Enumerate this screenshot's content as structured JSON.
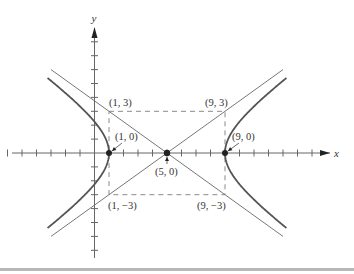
{
  "figure": {
    "equation": "(x-5)^2/16 - y^2/9 = 1",
    "axes": {
      "x_label": "x",
      "y_label": "y",
      "x_ticks_range": [
        -6,
        15
      ],
      "y_ticks_range": [
        -7,
        8
      ]
    },
    "points": [
      {
        "id": "vertex-left",
        "label": "(1, 0)",
        "x": 1,
        "y": 0
      },
      {
        "id": "center",
        "label": "(5, 0)",
        "x": 5,
        "y": 0
      },
      {
        "id": "vertex-right",
        "label": "(9, 0)",
        "x": 9,
        "y": 0
      }
    ],
    "rectangle_corners": [
      {
        "id": "top-left",
        "label": "(1, 3)",
        "x": 1,
        "y": 3
      },
      {
        "id": "top-right",
        "label": "(9, 3)",
        "x": 9,
        "y": 3
      },
      {
        "id": "bottom-left",
        "label": "(1, −3)",
        "x": 1,
        "y": -3
      },
      {
        "id": "bottom-right",
        "label": "(9, −3)",
        "x": 9,
        "y": -3
      }
    ],
    "asymptotes": [
      "y = (3/4)(x − 5)",
      "y = −(3/4)(x − 5)"
    ],
    "colors": {
      "curve": "#555555",
      "axis": "#666666",
      "asymptote": "#777777",
      "dashed": "#8a8a8a",
      "point": "#222222",
      "text": "#333333"
    }
  },
  "chart_data": {
    "type": "line",
    "title": "",
    "xlabel": "x",
    "ylabel": "y",
    "xlim": [
      -6,
      16
    ],
    "ylim": [
      -7,
      9
    ],
    "grid": false,
    "series": [
      {
        "name": "hyperbola right branch",
        "equation": "x = 5 + 4*sqrt(1 + y^2/9)"
      },
      {
        "name": "hyperbola left branch",
        "equation": "x = 5 - 4*sqrt(1 + y^2/9)"
      },
      {
        "name": "asymptote 1",
        "equation": "y = 0.75*(x-5)"
      },
      {
        "name": "asymptote 2",
        "equation": "y = -0.75*(x-5)"
      }
    ],
    "annotations": [
      "(1, 3)",
      "(9, 3)",
      "(1, 0)",
      "(9, 0)",
      "(5, 0)",
      "(1, −3)",
      "(9, −3)"
    ]
  }
}
